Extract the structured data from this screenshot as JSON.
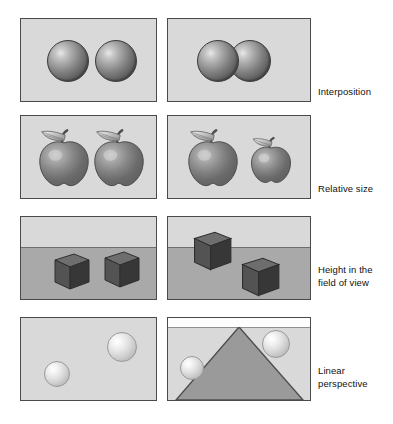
{
  "figure": {
    "background_color": "#ffffff",
    "panel_fill": "#d9d9d9",
    "panel_border": "#4a4a4a",
    "ground_fill": "#a9a9a9",
    "triangle_fill": "#9a9a9a",
    "label_color": "#111111"
  },
  "rows": [
    {
      "id": "interposition",
      "label": "Interposition",
      "label_lines": [
        "Interposition"
      ],
      "left_panel": {
        "name": "interposition-no-cue-panel",
        "content": "two separated dark spheres",
        "objects": [
          {
            "type": "sphere",
            "shade": "dark",
            "cx": 47,
            "cy": 42,
            "r": 21
          },
          {
            "type": "sphere",
            "shade": "dark",
            "cx": 95,
            "cy": 42,
            "r": 21
          }
        ]
      },
      "right_panel": {
        "name": "interposition-cue-panel",
        "content": "two overlapping dark spheres, left occludes right",
        "objects": [
          {
            "type": "sphere",
            "shade": "dark",
            "cx": 82,
            "cy": 42,
            "r": 21
          },
          {
            "type": "sphere",
            "shade": "dark",
            "cx": 50,
            "cy": 42,
            "r": 21
          }
        ]
      }
    },
    {
      "id": "relative-size",
      "label": "Relative size",
      "label_lines": [
        "Relative size"
      ],
      "left_panel": {
        "name": "relative-size-no-cue-panel",
        "content": "two apples of equal size",
        "objects": [
          {
            "type": "apple",
            "cx": 42,
            "cy": 46,
            "scale": 1.0
          },
          {
            "type": "apple",
            "cx": 97,
            "cy": 46,
            "scale": 1.0
          }
        ]
      },
      "right_panel": {
        "name": "relative-size-cue-panel",
        "content": "two apples, right one smaller",
        "objects": [
          {
            "type": "apple",
            "cx": 46,
            "cy": 46,
            "scale": 1.0
          },
          {
            "type": "apple",
            "cx": 103,
            "cy": 50,
            "scale": 0.8
          }
        ]
      }
    },
    {
      "id": "height-in-field-of-view",
      "label": "Height in the field of view",
      "label_lines": [
        "Height in the",
        "field of view"
      ],
      "left_panel": {
        "name": "height-no-cue-panel",
        "content": "two cubes side by side on ground plane, same height",
        "horizon_y": 32,
        "objects": [
          {
            "type": "cube",
            "x": 32,
            "y": 38,
            "size": 34
          },
          {
            "type": "cube",
            "x": 82,
            "y": 38,
            "size": 34
          }
        ]
      },
      "right_panel": {
        "name": "height-cue-panel",
        "content": "one cube high near horizon, one cube lower and nearer",
        "horizon_y": 32,
        "objects": [
          {
            "type": "cube",
            "x": 22,
            "y": 16,
            "size": 36
          },
          {
            "type": "cube",
            "x": 72,
            "y": 42,
            "size": 34
          }
        ]
      }
    },
    {
      "id": "linear-perspective",
      "label": "Linear perspective",
      "label_lines": [
        "Linear",
        "perspective"
      ],
      "left_panel": {
        "name": "linear-perspective-no-cue-panel",
        "content": "two light spheres on plain background",
        "objects": [
          {
            "type": "sphere",
            "shade": "light",
            "cx": 36,
            "cy": 56,
            "r": 13
          },
          {
            "type": "sphere",
            "shade": "light",
            "cx": 101,
            "cy": 29,
            "r": 15
          }
        ]
      },
      "right_panel": {
        "name": "linear-perspective-cue-panel",
        "content": "converging triangle (road) with two light spheres",
        "objects": [
          {
            "type": "triangle",
            "apex_x": 72,
            "apex_y": 8,
            "base_left": 12,
            "base_right": 134,
            "base_y": 84
          },
          {
            "type": "sphere",
            "shade": "light",
            "cx": 24,
            "cy": 50,
            "r": 12
          },
          {
            "type": "sphere",
            "shade": "light",
            "cx": 108,
            "cy": 26,
            "r": 14
          }
        ]
      }
    }
  ]
}
